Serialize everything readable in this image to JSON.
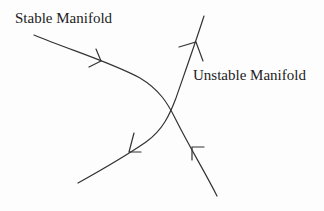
{
  "diagram": {
    "type": "saddle-point phase portrait",
    "labels": {
      "stable": "Stable Manifold",
      "unstable": "Unstable Manifold"
    },
    "colors": {
      "stroke": "#333333",
      "text": "#222222",
      "background": "#fdfdfd"
    },
    "curves": [
      {
        "name": "stable-manifold",
        "path": "M34,35 C70,50 110,62 140,78 C160,90 168,105 175,120 C190,150 205,172 217,196",
        "arrows": [
          {
            "at": [
              101,
              61
            ],
            "direction": "toward saddle (right/down)"
          },
          {
            "at": [
              192,
              151
            ],
            "direction": "toward saddle (up/left)"
          }
        ]
      },
      {
        "name": "unstable-manifold",
        "path": "M78,183 C105,168 130,152 148,140 C165,128 172,110 178,95 C186,70 195,42 204,16",
        "arrows": [
          {
            "at": [
              130,
              152
            ],
            "direction": "away from saddle (down/left)"
          },
          {
            "at": [
              196,
              42
            ],
            "direction": "away from saddle (up)"
          }
        ]
      }
    ],
    "saddle_point": [
      170,
      113
    ]
  }
}
